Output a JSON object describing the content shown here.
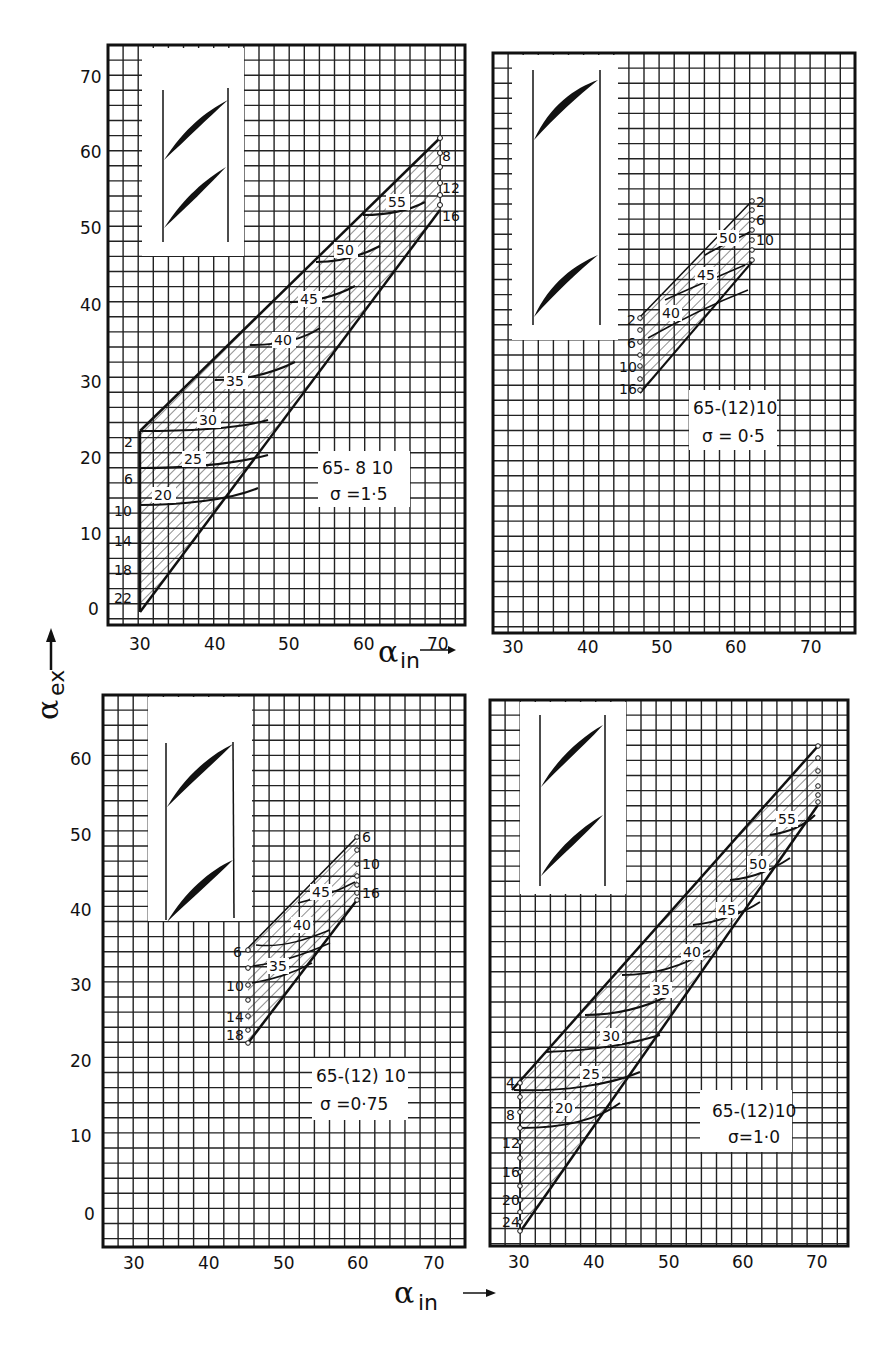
{
  "figure": {
    "y_axis_label": "α",
    "y_axis_sub": "ex",
    "x_axis_label": "α",
    "x_axis_sub": "in",
    "caption": ""
  },
  "chart_data": [
    {
      "type": "line",
      "title": "65-8 10, σ = 1.5",
      "box_line1": "65- 8 10",
      "box_line2": "σ =1·5",
      "xlabel": "α_in",
      "ylabel": "α_ex",
      "xlim": [
        26,
        74
      ],
      "ylim": [
        -3,
        73
      ],
      "xticks": [
        30,
        40,
        50,
        60,
        70
      ],
      "yticks": [
        0,
        10,
        20,
        30,
        40,
        50,
        60,
        70
      ],
      "incidence_labels_left": [
        "2",
        "6",
        "10",
        "14",
        "18",
        "22"
      ],
      "incidence_labels_right": [
        "8",
        "12",
        "16"
      ],
      "alpha_in_curve_labels": [
        "20",
        "25",
        "30",
        "35",
        "40",
        "45",
        "50",
        "55"
      ],
      "envelope": {
        "upper": [
          [
            30,
            23.5
          ],
          [
            70,
            62
          ]
        ],
        "lower": [
          [
            30,
            -1
          ],
          [
            70,
            52
          ]
        ]
      },
      "grid": true
    },
    {
      "type": "line",
      "title": "65-(12)10, σ = 0.5",
      "box_line1": "65-(12)10",
      "box_line2": "σ = 0·5",
      "xlabel": "α_in",
      "ylabel": "α_ex",
      "xlim": [
        26,
        74
      ],
      "ylim": [
        -3,
        73
      ],
      "xticks": [
        30,
        40,
        50,
        60,
        70
      ],
      "incidence_labels_left": [
        "2",
        "6",
        "10",
        "16"
      ],
      "incidence_labels_right": [
        "2",
        "6",
        "10"
      ],
      "alpha_in_curve_labels": [
        "40",
        "45",
        "50"
      ],
      "envelope": {
        "upper": [
          [
            45,
            38.5
          ],
          [
            60,
            53.5
          ]
        ],
        "lower": [
          [
            45,
            28.5
          ],
          [
            60,
            46
          ]
        ]
      },
      "grid": true
    },
    {
      "type": "line",
      "title": "65-(12)10, σ = 0.75",
      "box_line1": "65-(12) 10",
      "box_line2": "σ  =0·75",
      "xlabel": "α_in",
      "ylabel": "α_ex",
      "xlim": [
        26,
        74
      ],
      "ylim": [
        -4,
        65
      ],
      "xticks": [
        30,
        40,
        50,
        60,
        70
      ],
      "yticks": [
        0,
        10,
        20,
        30,
        40,
        50,
        60
      ],
      "incidence_labels_left": [
        "6",
        "10",
        "14",
        "18"
      ],
      "incidence_labels_right": [
        "6",
        "10",
        "16"
      ],
      "alpha_in_curve_labels": [
        "35",
        "40",
        "45"
      ],
      "envelope": {
        "upper": [
          [
            45,
            35
          ],
          [
            60,
            49.5
          ]
        ],
        "lower": [
          [
            45,
            22.5
          ],
          [
            60,
            41.5
          ]
        ]
      },
      "grid": true
    },
    {
      "type": "line",
      "title": "65-(12)10, σ = 1.0",
      "box_line1": "65-(12)10",
      "box_line2": "σ=1·0",
      "xlabel": "α_in",
      "ylabel": "α_ex",
      "xlim": [
        26,
        74
      ],
      "ylim": [
        -4,
        65
      ],
      "xticks": [
        30,
        40,
        50,
        60,
        70
      ],
      "incidence_labels_left": [
        "4",
        "8",
        "12",
        "16",
        "20",
        "24"
      ],
      "alpha_in_curve_labels": [
        "20",
        "25",
        "30",
        "35",
        "40",
        "45",
        "50",
        "55"
      ],
      "envelope": {
        "upper": [
          [
            30,
            16.5
          ],
          [
            70,
            61.5
          ]
        ],
        "lower": [
          [
            30,
            -3
          ],
          [
            70,
            53.5
          ]
        ]
      },
      "grid": true
    }
  ]
}
